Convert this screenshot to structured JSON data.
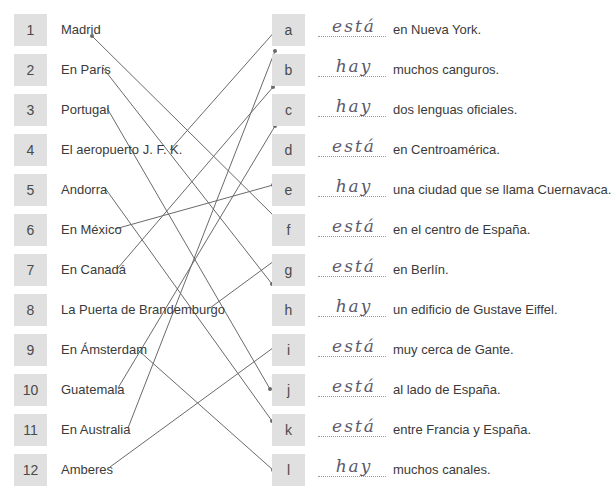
{
  "left_items": [
    {
      "number": "1",
      "label": "Madrid"
    },
    {
      "number": "2",
      "label": "En París"
    },
    {
      "number": "3",
      "label": "Portugal"
    },
    {
      "number": "4",
      "label": "El aeropuerto J. F. K."
    },
    {
      "number": "5",
      "label": "Andorra"
    },
    {
      "number": "6",
      "label": "En México"
    },
    {
      "number": "7",
      "label": "En Canadá"
    },
    {
      "number": "8",
      "label": "La Puerta de Brandemburgo"
    },
    {
      "number": "9",
      "label": "En Ámsterdam"
    },
    {
      "number": "10",
      "label": "Guatemala"
    },
    {
      "number": "11",
      "label": "En Australia"
    },
    {
      "number": "12",
      "label": "Amberes"
    }
  ],
  "right_items": [
    {
      "letter": "a",
      "answer": "está",
      "sentence": "en Nueva York."
    },
    {
      "letter": "b",
      "answer": "hay",
      "sentence": "muchos canguros."
    },
    {
      "letter": "c",
      "answer": "hay",
      "sentence": "dos lenguas oficiales."
    },
    {
      "letter": "d",
      "answer": "está",
      "sentence": "en Centroamérica."
    },
    {
      "letter": "e",
      "answer": "hay",
      "sentence": "una ciudad que se llama Cuernavaca."
    },
    {
      "letter": "f",
      "answer": "está",
      "sentence": "en el centro de España."
    },
    {
      "letter": "g",
      "answer": "está",
      "sentence": "en Berlín."
    },
    {
      "letter": "h",
      "answer": "hay",
      "sentence": "un edificio de Gustave Eiffel."
    },
    {
      "letter": "i",
      "answer": "está",
      "sentence": "muy cerca de Gante."
    },
    {
      "letter": "j",
      "answer": "está",
      "sentence": "al lado de España."
    },
    {
      "letter": "k",
      "answer": "está",
      "sentence": "entre Francia y España."
    },
    {
      "letter": "l",
      "answer": "hay",
      "sentence": "muchos canales."
    }
  ],
  "matches": [
    {
      "from": "1",
      "to": "f"
    },
    {
      "from": "2",
      "to": "h"
    },
    {
      "from": "3",
      "to": "j"
    },
    {
      "from": "4",
      "to": "a"
    },
    {
      "from": "5",
      "to": "k"
    },
    {
      "from": "6",
      "to": "e"
    },
    {
      "from": "7",
      "to": "c"
    },
    {
      "from": "8",
      "to": "g"
    },
    {
      "from": "9",
      "to": "l"
    },
    {
      "from": "10",
      "to": "d"
    },
    {
      "from": "11",
      "to": "b"
    },
    {
      "from": "12",
      "to": "i"
    }
  ],
  "colors": {
    "box_fill": "#e0e0e0",
    "line": "#6a6a6a",
    "handwriting": "#5a5a6a"
  }
}
